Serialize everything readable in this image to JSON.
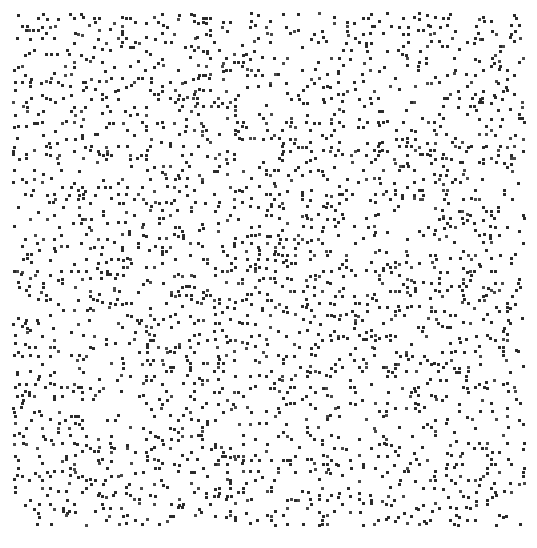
{
  "figure": {
    "title": "",
    "subtitle": "",
    "background_color": "#ffffff",
    "width": 537,
    "height": 548
  },
  "chart_data": {
    "type": "scatter",
    "title": "",
    "subtitle": "",
    "xlabel": "",
    "ylabel": "",
    "xlim": [
      0,
      256
    ],
    "ylim": [
      0,
      256
    ],
    "grid": false,
    "axes_visible": false,
    "tick_labels_x": [],
    "tick_labels_y": [],
    "legend": {
      "visible": false,
      "position": "none",
      "entries": []
    },
    "annotations": [],
    "series": [
      {
        "name": "lattice-points",
        "marker": "square",
        "marker_size_px": 3,
        "color": "#2b2b2b",
        "point_count": 2050,
        "description": "Dense pseudo-random lattice scatter with faint diagonal striations radiating from the plot centre",
        "generator": {
          "method": "coprime-modular-lattice",
          "grid_nx": 128,
          "grid_ny": 128,
          "center_x": 128,
          "center_y": 128,
          "seed": 20240917,
          "base_density": 0.125
        }
      }
    ]
  },
  "plot_box": {
    "left_margin_px": 13,
    "top_margin_px": 13,
    "right_margin_px": 11,
    "bottom_margin_px": 21,
    "inner_width_px": 513,
    "inner_height_px": 514
  },
  "colors": {
    "background": "#ffffff",
    "point": "#2b2b2b",
    "point_light": "#4a4a4a"
  }
}
